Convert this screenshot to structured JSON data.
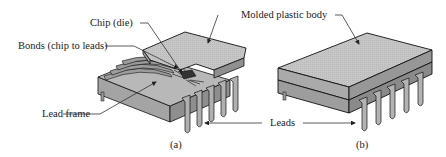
{
  "figure": {
    "labels": {
      "chip": "Chip (die)",
      "bonds": "Bonds (chip to leads)",
      "lead_frame": "Lead frame",
      "body": "Molded plastic body",
      "leads": "Leads"
    },
    "panels": [
      {
        "id": "a",
        "caption": "(a)"
      },
      {
        "id": "b",
        "caption": "(b)"
      }
    ],
    "colors": {
      "top_face": "#c8c8c8",
      "side_face": "#a9a9a9",
      "front_face": "#9a9a9a",
      "lead": "#b5b5b5",
      "outline": "#1a1a1a",
      "leader": "#333333"
    }
  }
}
